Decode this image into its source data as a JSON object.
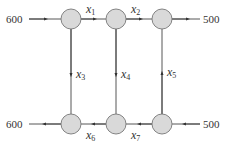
{
  "diagram": {
    "type": "network-flow",
    "nodes": [
      {
        "id": "A",
        "cx": 71,
        "cy": 19
      },
      {
        "id": "B",
        "cx": 116,
        "cy": 19
      },
      {
        "id": "C",
        "cx": 162,
        "cy": 19
      },
      {
        "id": "D",
        "cx": 71,
        "cy": 124
      },
      {
        "id": "E",
        "cx": 116,
        "cy": 124
      },
      {
        "id": "F",
        "cx": 162,
        "cy": 124
      }
    ],
    "external": {
      "in_top_left": "600",
      "out_top_right": "500",
      "out_bottom_left": "600",
      "in_bottom_right": "500"
    },
    "edges": [
      {
        "var": "x",
        "sub": "1",
        "from": "A",
        "to": "B"
      },
      {
        "var": "x",
        "sub": "2",
        "from": "B",
        "to": "C"
      },
      {
        "var": "x",
        "sub": "3",
        "from": "A",
        "to": "D"
      },
      {
        "var": "x",
        "sub": "4",
        "from": "B",
        "to": "E"
      },
      {
        "var": "x",
        "sub": "5",
        "from": "F",
        "to": "C"
      },
      {
        "var": "x",
        "sub": "6",
        "from": "E",
        "to": "D"
      },
      {
        "var": "x",
        "sub": "7",
        "from": "F",
        "to": "E"
      }
    ],
    "colors": {
      "node_fill": "#d9d9d9",
      "node_stroke": "#777777",
      "edge": "#444444"
    }
  }
}
